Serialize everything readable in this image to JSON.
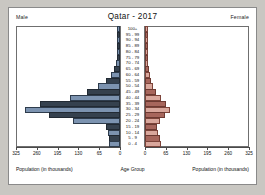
{
  "header": {
    "title": "Qatar - 2017",
    "male_label": "Male",
    "female_label": "Female"
  },
  "footer": {
    "left_axis_title": "Population (in thousands)",
    "center_axis_title": "Age Group",
    "right_axis_title": "Population (in thousands)"
  },
  "axis": {
    "left_ticks": [
      "325",
      "260",
      "195",
      "130",
      "65",
      "0"
    ],
    "right_ticks": [
      "0",
      "65",
      "130",
      "195",
      "260",
      "325"
    ],
    "max": 325
  },
  "colors": {
    "male_light": "#7c93b0",
    "male_dark": "#35414e",
    "female_light": "#d9a79c",
    "female_dark": "#a7665c",
    "background": "#ffffff",
    "frame": "#8a8a8a"
  },
  "chart_data": {
    "type": "bar",
    "subtype": "population-pyramid",
    "title": "Qatar - 2017",
    "xlabel": "Population (in thousands)",
    "ylabel": "Age Group",
    "xlim": [
      0,
      325
    ],
    "grid": false,
    "legend_position": "top-corners",
    "categories": [
      "100+",
      "95 - 99",
      "90 - 94",
      "85 - 89",
      "80 - 84",
      "75 - 79",
      "70 - 74",
      "65 - 69",
      "60 - 64",
      "55 - 59",
      "50 - 54",
      "45 - 49",
      "40 - 44",
      "35 - 39",
      "30 - 34",
      "25 - 29",
      "20 - 24",
      "15 - 19",
      "10 - 14",
      "5 - 9",
      "0 - 4"
    ],
    "series": [
      {
        "name": "Male",
        "values": [
          0.1,
          0.2,
          0.4,
          0.8,
          1.6,
          3.0,
          5.5,
          11.0,
          22.0,
          38.0,
          62.0,
          97.0,
          150.0,
          243.0,
          290.0,
          215.0,
          140.0,
          38.0,
          30.0,
          28.0,
          27.0
        ]
      },
      {
        "name": "Female",
        "values": [
          0.1,
          0.2,
          0.4,
          0.7,
          1.2,
          2.0,
          3.2,
          5.0,
          8.0,
          12.0,
          18.0,
          27.0,
          43.0,
          58.0,
          72.0,
          56.0,
          40.0,
          30.0,
          33.0,
          40.0,
          45.0
        ]
      }
    ]
  }
}
